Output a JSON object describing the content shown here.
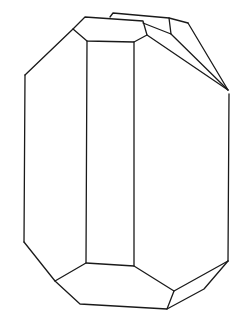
{
  "figure": {
    "stroke_color": "#1a1a1a",
    "background": "#ffffff",
    "edges": [
      {
        "id": "left-top-slant",
        "points": "73,29 25,75"
      },
      {
        "id": "left-vertical",
        "points": "25,75 24,242"
      },
      {
        "id": "left-bottom-slant",
        "points": "24,242 55,281"
      },
      {
        "id": "top-face",
        "points": "73,29 85,17 143,21 147,35 134,42 87,41 73,29"
      },
      {
        "id": "front-left-vertical",
        "points": "87,41 86,263"
      },
      {
        "id": "front-right-vertical",
        "points": "134,42 134,266"
      },
      {
        "id": "back-top-edge",
        "points": "110,17 113,13 169,18 188,23"
      },
      {
        "id": "back-inner-edge",
        "points": "169,18 171,34 143,23"
      },
      {
        "id": "right-upper-slant-1",
        "points": "147,35 228,90"
      },
      {
        "id": "right-upper-slant-2",
        "points": "171,34 228,90"
      },
      {
        "id": "right-upper-slant-3",
        "points": "188,23 228,90"
      },
      {
        "id": "right-vertical",
        "points": "229,94 228,261"
      },
      {
        "id": "bottom-face",
        "points": "55,281 86,263 134,266 174,291 167,309 80,304 55,281"
      },
      {
        "id": "bottom-right-1",
        "points": "174,291 228,261"
      },
      {
        "id": "bottom-right-2",
        "points": "167,309 204,289 228,261"
      }
    ]
  }
}
